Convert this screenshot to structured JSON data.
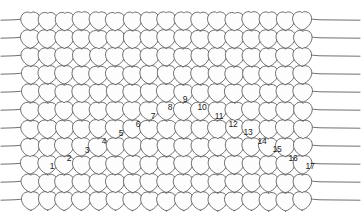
{
  "figure": {
    "background_color": "#ffffff",
    "loop_stroke_color": "#555555",
    "loop_fill_color": "#fdfdfd",
    "selvedge_stroke_color": "#606060",
    "number_color": "#1c1c1c"
  },
  "grid": {
    "columns": 17,
    "rows": 11,
    "cell_width": 17.0,
    "cell_height": 18.0,
    "origin_x": 22.0,
    "origin_y": 12.0,
    "row_offset_x": 0.0
  },
  "selvedge": {
    "left_x_start": 1.0,
    "right_x_end": 360.0,
    "yarn_count_left": 8,
    "yarn_count_right": 8
  },
  "numbered_stitches": [
    {
      "label": "1",
      "x": 52,
      "y": 166
    },
    {
      "label": "2",
      "x": 69,
      "y": 158
    },
    {
      "label": "3",
      "x": 87,
      "y": 150
    },
    {
      "label": "4",
      "x": 104,
      "y": 141
    },
    {
      "label": "5",
      "x": 121,
      "y": 133
    },
    {
      "label": "6",
      "x": 138,
      "y": 124
    },
    {
      "label": "7",
      "x": 153,
      "y": 116
    },
    {
      "label": "8",
      "x": 170,
      "y": 107
    },
    {
      "label": "9",
      "x": 185,
      "y": 99
    },
    {
      "label": "10",
      "x": 202,
      "y": 107
    },
    {
      "label": "11",
      "x": 219,
      "y": 116
    },
    {
      "label": "12",
      "x": 233,
      "y": 124
    },
    {
      "label": "13",
      "x": 248,
      "y": 132
    },
    {
      "label": "14",
      "x": 262,
      "y": 141
    },
    {
      "label": "15",
      "x": 277,
      "y": 149
    },
    {
      "label": "16",
      "x": 293,
      "y": 158
    },
    {
      "label": "17",
      "x": 310,
      "y": 166
    }
  ]
}
